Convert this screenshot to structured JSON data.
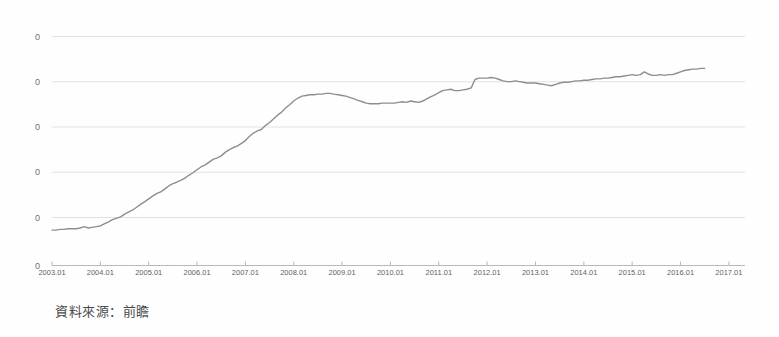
{
  "caption": {
    "source_text": "資料來源：前瞻"
  },
  "colors": {
    "line": "#8e8e8e",
    "gridline": "#e2e2e2",
    "axis": "#b9b9b9",
    "tick_text": "#5f5f5f",
    "y_tick_text": "#6e6e6e",
    "caption_text": "#4a4a4a",
    "background": "#fefefe"
  },
  "chart_data": {
    "type": "line",
    "title": "",
    "subtitle": "",
    "xlabel": "",
    "ylabel": "",
    "grid": true,
    "legend": false,
    "legend_position": "none",
    "x_tick_labels": [
      "2003.01",
      "2004.01",
      "2005.01",
      "2006.01",
      "2007.01",
      "2008.01",
      "2009.01",
      "2010.01",
      "2011.01",
      "2012.01",
      "2013.01",
      "2014.01",
      "2015.01",
      "2016.01",
      "2017.01"
    ],
    "y_tick_labels": [
      "0",
      "0",
      "0",
      "0",
      "0",
      "0"
    ],
    "y_tick_note": "Y-axis value labels are cropped at the left edge of the screenshot; only the trailing digit 0 of each label is visible.",
    "xlim": [
      "2003.01",
      "2017.05"
    ],
    "ylim_pixels": [
      265,
      36
    ],
    "series": [
      {
        "name": "series-1",
        "points": [
          [
            2003.0,
            51
          ],
          [
            2003.08,
            51
          ],
          [
            2003.17,
            52
          ],
          [
            2003.25,
            52
          ],
          [
            2003.33,
            53
          ],
          [
            2003.42,
            53
          ],
          [
            2003.5,
            53
          ],
          [
            2003.58,
            54
          ],
          [
            2003.67,
            56
          ],
          [
            2003.75,
            54
          ],
          [
            2003.83,
            55
          ],
          [
            2003.92,
            56
          ],
          [
            2004.0,
            57
          ],
          [
            2004.08,
            60
          ],
          [
            2004.17,
            63
          ],
          [
            2004.25,
            66
          ],
          [
            2004.33,
            68
          ],
          [
            2004.42,
            70
          ],
          [
            2004.5,
            74
          ],
          [
            2004.58,
            77
          ],
          [
            2004.67,
            80
          ],
          [
            2004.75,
            84
          ],
          [
            2004.83,
            88
          ],
          [
            2004.92,
            92
          ],
          [
            2005.0,
            96
          ],
          [
            2005.08,
            100
          ],
          [
            2005.17,
            104
          ],
          [
            2005.25,
            106
          ],
          [
            2005.33,
            110
          ],
          [
            2005.42,
            115
          ],
          [
            2005.5,
            118
          ],
          [
            2005.58,
            120
          ],
          [
            2005.67,
            123
          ],
          [
            2005.75,
            126
          ],
          [
            2005.83,
            130
          ],
          [
            2005.92,
            134
          ],
          [
            2006.0,
            138
          ],
          [
            2006.08,
            142
          ],
          [
            2006.17,
            145
          ],
          [
            2006.25,
            149
          ],
          [
            2006.33,
            153
          ],
          [
            2006.42,
            155
          ],
          [
            2006.5,
            158
          ],
          [
            2006.58,
            163
          ],
          [
            2006.67,
            167
          ],
          [
            2006.75,
            170
          ],
          [
            2006.83,
            172
          ],
          [
            2006.92,
            176
          ],
          [
            2007.0,
            180
          ],
          [
            2007.08,
            186
          ],
          [
            2007.17,
            191
          ],
          [
            2007.25,
            194
          ],
          [
            2007.33,
            196
          ],
          [
            2007.42,
            202
          ],
          [
            2007.5,
            206
          ],
          [
            2007.58,
            211
          ],
          [
            2007.67,
            217
          ],
          [
            2007.75,
            221
          ],
          [
            2007.83,
            227
          ],
          [
            2007.92,
            232
          ],
          [
            2008.0,
            237
          ],
          [
            2008.08,
            241
          ],
          [
            2008.17,
            244
          ],
          [
            2008.25,
            245
          ],
          [
            2008.33,
            246
          ],
          [
            2008.42,
            246
          ],
          [
            2008.5,
            247
          ],
          [
            2008.58,
            247
          ],
          [
            2008.67,
            248
          ],
          [
            2008.75,
            248
          ],
          [
            2008.83,
            247
          ],
          [
            2008.92,
            246
          ],
          [
            2009.0,
            245
          ],
          [
            2009.08,
            244
          ],
          [
            2009.17,
            242
          ],
          [
            2009.25,
            240
          ],
          [
            2009.33,
            238
          ],
          [
            2009.42,
            236
          ],
          [
            2009.5,
            234
          ],
          [
            2009.58,
            233
          ],
          [
            2009.67,
            233
          ],
          [
            2009.75,
            233
          ],
          [
            2009.83,
            234
          ],
          [
            2009.92,
            234
          ],
          [
            2010.0,
            234
          ],
          [
            2010.08,
            234
          ],
          [
            2010.17,
            235
          ],
          [
            2010.25,
            236
          ],
          [
            2010.33,
            235
          ],
          [
            2010.42,
            237
          ],
          [
            2010.5,
            236
          ],
          [
            2010.58,
            235
          ],
          [
            2010.67,
            237
          ],
          [
            2010.75,
            240
          ],
          [
            2010.83,
            243
          ],
          [
            2010.92,
            246
          ],
          [
            2011.0,
            249
          ],
          [
            2011.08,
            252
          ],
          [
            2011.17,
            253
          ],
          [
            2011.25,
            254
          ],
          [
            2011.33,
            252
          ],
          [
            2011.42,
            252
          ],
          [
            2011.5,
            253
          ],
          [
            2011.58,
            254
          ],
          [
            2011.67,
            256
          ],
          [
            2011.75,
            268
          ],
          [
            2011.83,
            270
          ],
          [
            2011.92,
            270
          ],
          [
            2012.0,
            270
          ],
          [
            2012.08,
            271
          ],
          [
            2012.17,
            270
          ],
          [
            2012.25,
            268
          ],
          [
            2012.33,
            266
          ],
          [
            2012.42,
            265
          ],
          [
            2012.5,
            265
          ],
          [
            2012.58,
            266
          ],
          [
            2012.67,
            265
          ],
          [
            2012.75,
            264
          ],
          [
            2012.83,
            263
          ],
          [
            2012.92,
            263
          ],
          [
            2013.0,
            263
          ],
          [
            2013.08,
            262
          ],
          [
            2013.17,
            261
          ],
          [
            2013.25,
            260
          ],
          [
            2013.33,
            259
          ],
          [
            2013.42,
            261
          ],
          [
            2013.5,
            263
          ],
          [
            2013.58,
            264
          ],
          [
            2013.67,
            264
          ],
          [
            2013.75,
            265
          ],
          [
            2013.83,
            266
          ],
          [
            2013.92,
            266
          ],
          [
            2014.0,
            267
          ],
          [
            2014.08,
            267
          ],
          [
            2014.17,
            268
          ],
          [
            2014.25,
            269
          ],
          [
            2014.33,
            269
          ],
          [
            2014.42,
            270
          ],
          [
            2014.5,
            270
          ],
          [
            2014.58,
            271
          ],
          [
            2014.67,
            272
          ],
          [
            2014.75,
            272
          ],
          [
            2014.83,
            273
          ],
          [
            2014.92,
            274
          ],
          [
            2015.0,
            275
          ],
          [
            2015.08,
            274
          ],
          [
            2015.17,
            275
          ],
          [
            2015.25,
            279
          ],
          [
            2015.33,
            276
          ],
          [
            2015.42,
            274
          ],
          [
            2015.5,
            274
          ],
          [
            2015.58,
            275
          ],
          [
            2015.67,
            274
          ],
          [
            2015.75,
            275
          ],
          [
            2015.83,
            275
          ],
          [
            2015.92,
            277
          ],
          [
            2016.0,
            279
          ],
          [
            2016.08,
            281
          ],
          [
            2016.17,
            282
          ],
          [
            2016.25,
            283
          ],
          [
            2016.33,
            283
          ],
          [
            2016.42,
            284
          ],
          [
            2016.5,
            284
          ]
        ]
      }
    ]
  }
}
